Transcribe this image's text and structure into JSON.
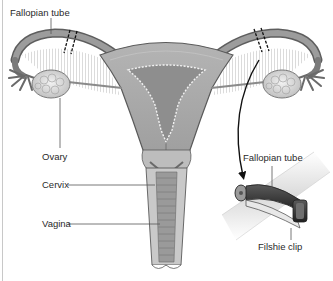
{
  "figure": {
    "labels": {
      "fallopian_tube_left": "Fallopian tube",
      "ovary": "Ovary",
      "cervix": "Cervix",
      "vagina": "Vagina",
      "fallopian_tube_inset": "Fallopian tube",
      "filshie_clip": "Filshie clip"
    },
    "colors": {
      "background": "#ffffff",
      "tissue_dark": "#8a8a8a",
      "tissue_mid": "#a9a9a9",
      "tissue_light": "#d6d6d6",
      "outline": "#5a5a5a",
      "clip": "#3a3a3a",
      "leader_line": "#555555",
      "text": "#2a2a2a"
    },
    "annotations": {
      "cut_marks": "dashed double line across each fallopian tube",
      "arrow": "curved arrow from right tube to clip inset"
    }
  }
}
